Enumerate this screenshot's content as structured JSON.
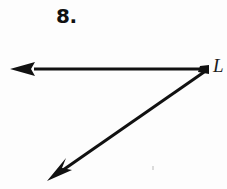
{
  "figure": {
    "problem_number": "8.",
    "vertex_label": "L",
    "background_color": "#fdfdfd",
    "ink_color": "#111111",
    "speck_color": "#cfcfcf",
    "geometry": {
      "type": "angle",
      "vertex": {
        "x": 207,
        "y": 69
      },
      "rays": [
        {
          "name": "horizontal-ray",
          "from": {
            "x": 207,
            "y": 69
          },
          "to": {
            "x": 12,
            "y": 69
          },
          "arrowhead": "left",
          "stroke_width": 3
        },
        {
          "name": "diagonal-ray",
          "from": {
            "x": 207,
            "y": 70
          },
          "to": {
            "x": 49,
            "y": 179
          },
          "arrowhead": "down-left",
          "stroke_width": 3
        }
      ]
    }
  }
}
